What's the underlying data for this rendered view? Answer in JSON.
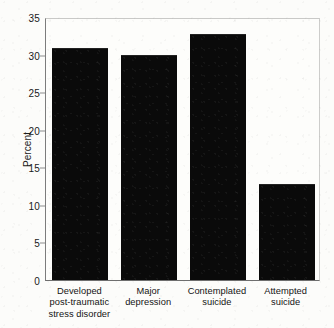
{
  "chart_data": {
    "type": "bar",
    "title": "",
    "subtitle": "",
    "xlabel": "",
    "ylabel": "Percent",
    "ylim": [
      0,
      35
    ],
    "yticks": [
      0,
      5,
      10,
      15,
      20,
      25,
      30,
      35
    ],
    "ytick_labels": [
      "0",
      "5",
      "10",
      "15",
      "20",
      "25",
      "30",
      "35"
    ],
    "grid": false,
    "legend": false,
    "legend_position": "none",
    "bar_color": "#0a0a0a",
    "background_color": "#fcfcfa",
    "categories": [
      "Developed post-traumatic stress disorder",
      "Major depression",
      "Contemplated suicide",
      "Attempted suicide"
    ],
    "category_lines": [
      [
        "Developed",
        "post-traumatic",
        "stress disorder"
      ],
      [
        "Major",
        "depression"
      ],
      [
        "Contemplated",
        "suicide"
      ],
      [
        "Attempted",
        "suicide"
      ]
    ],
    "values": [
      30.9,
      29.9,
      32.7,
      12.8
    ],
    "value_unit": "percent"
  }
}
